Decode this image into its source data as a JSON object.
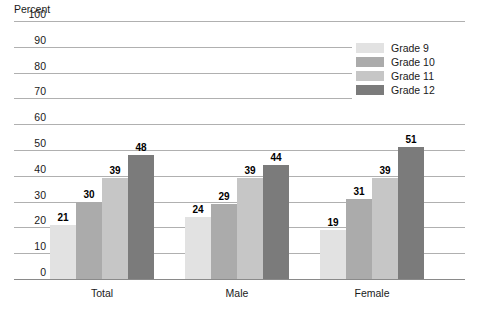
{
  "chart_data": {
    "type": "bar",
    "title": "",
    "subtitle": "",
    "xlabel": "",
    "ylabel": "Percent",
    "ylim": [
      0,
      100
    ],
    "yticks": [
      100,
      90,
      80,
      70,
      60,
      50,
      40,
      30,
      20,
      10,
      0
    ],
    "grid": true,
    "legend_position": "top-right",
    "categories": [
      "Total",
      "Male",
      "Female"
    ],
    "series": [
      {
        "name": "Grade 9",
        "color": "#e2e2e2",
        "values": [
          21,
          24,
          19
        ]
      },
      {
        "name": "Grade 10",
        "color": "#ababab",
        "values": [
          30,
          29,
          31
        ]
      },
      {
        "name": "Grade 11",
        "color": "#c6c6c6",
        "values": [
          39,
          39,
          39
        ]
      },
      {
        "name": "Grade 12",
        "color": "#7b7b7b",
        "values": [
          48,
          44,
          51
        ]
      }
    ]
  },
  "axis": {
    "y_title": "Percent"
  },
  "legend": {
    "items": [
      {
        "label": "Grade 9",
        "color": "#e2e2e2"
      },
      {
        "label": "Grade 10",
        "color": "#ababab"
      },
      {
        "label": "Grade 11",
        "color": "#c6c6c6"
      },
      {
        "label": "Grade 12",
        "color": "#7b7b7b"
      }
    ]
  },
  "colors": {
    "gridline": "#b0b0b0",
    "baseline": "#8a8a8a",
    "text": "#1a1a1a",
    "background": "#ffffff"
  }
}
